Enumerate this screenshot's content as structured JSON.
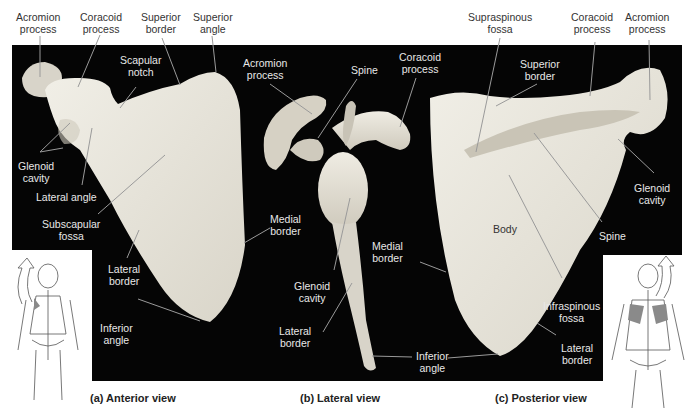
{
  "figure": {
    "panels": [
      {
        "id": "a",
        "caption": "(a) Anterior view",
        "labels": {
          "acromion_process": [
            "Acromion",
            "process"
          ],
          "coracoid_process": [
            "Coracoid",
            "process"
          ],
          "superior_border": [
            "Superior",
            "border"
          ],
          "superior_angle": [
            "Superior",
            "angle"
          ],
          "scapular_notch": [
            "Scapular",
            "notch"
          ],
          "glenoid_cavity": [
            "Glenoid",
            "cavity"
          ],
          "lateral_angle": [
            "Lateral angle"
          ],
          "subscapular_fossa": [
            "Subscapular",
            "fossa"
          ],
          "lateral_border": [
            "Lateral",
            "border"
          ],
          "inferior_angle": [
            "Inferior",
            "angle"
          ],
          "medial_border": [
            "Medial",
            "border"
          ]
        }
      },
      {
        "id": "b",
        "caption": "(b) Lateral view",
        "labels": {
          "acromion_process": [
            "Acromion",
            "process"
          ],
          "spine": [
            "Spine"
          ],
          "coracoid_process": [
            "Coracoid",
            "process"
          ],
          "glenoid_cavity": [
            "Glenoid",
            "cavity"
          ],
          "lateral_border": [
            "Lateral",
            "border"
          ],
          "inferior_angle": [
            "Inferior",
            "angle"
          ]
        }
      },
      {
        "id": "c",
        "caption": "(c) Posterior view",
        "labels": {
          "supraspinous_fossa": [
            "Supraspinous",
            "fossa"
          ],
          "coracoid_process": [
            "Coracoid",
            "process"
          ],
          "acromion_process": [
            "Acromion",
            "process"
          ],
          "superior_border": [
            "Superior",
            "border"
          ],
          "glenoid_cavity": [
            "Glenoid",
            "cavity"
          ],
          "body": [
            "Body"
          ],
          "spine": [
            "Spine"
          ],
          "medial_border": [
            "Medial",
            "border"
          ],
          "infraspinous_fossa": [
            "Infraspinous",
            "fossa"
          ],
          "lateral_border": [
            "Lateral",
            "border"
          ]
        }
      }
    ],
    "colors": {
      "background_panel": "#050505",
      "bone": "#e9e6dc",
      "label_on_white": "#333333",
      "label_on_black": "#e8e8e8",
      "leader_line": "#9a9a9a",
      "scapula_highlight": "#8a8a8a"
    }
  }
}
